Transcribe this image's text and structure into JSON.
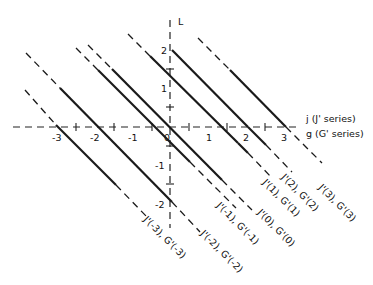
{
  "diagram": {
    "vertical_axis_label": "L",
    "horizontal_axis_label_top": "j (J' series)",
    "horizontal_axis_label_bottom": "g (G' series)",
    "x_ticks": [
      "-3",
      "-2",
      "-1",
      "0",
      "1",
      "2",
      "3"
    ],
    "y_ticks": [
      "2",
      "1",
      "-1",
      "-2"
    ],
    "lines": [
      {
        "n": -3,
        "label": "J'(-3), G'(-3)"
      },
      {
        "n": -2,
        "label": "J'(-2), G'(-2)"
      },
      {
        "n": -1,
        "label": "J'(-1), G'(-1)"
      },
      {
        "n": 0,
        "label": "J'(0), G'(0)"
      },
      {
        "n": 1,
        "label": "J'(1), G'(1)"
      },
      {
        "n": 2,
        "label": "J'(2), G'(2)"
      },
      {
        "n": 3,
        "label": "J'(3), G'(3)"
      }
    ],
    "colors": {
      "ink": "#1a1a1a",
      "background": "#ffffff"
    }
  }
}
